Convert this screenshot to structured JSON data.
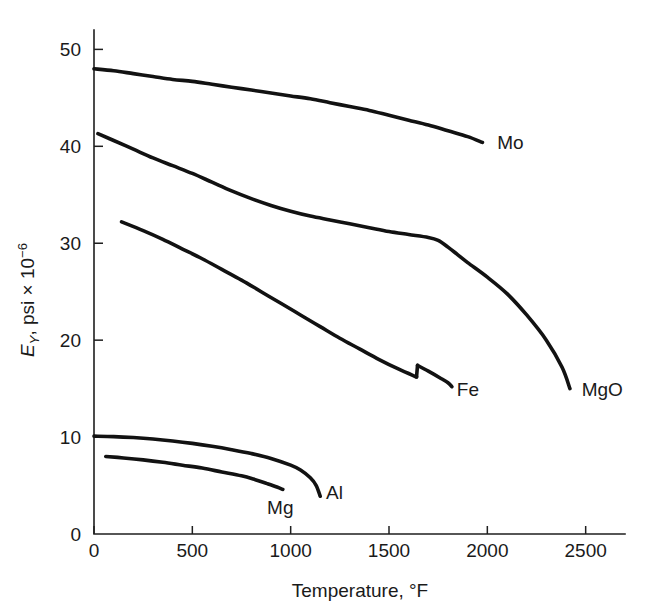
{
  "chart_data": {
    "type": "line",
    "title": "",
    "xlabel": "Temperature, °F",
    "ylabel": "Eᵧ, psi × 10⁻⁶",
    "ylabel_parts": {
      "symbol": "E",
      "subscript": "Y",
      "rest": ", psi × 10",
      "exponent": "−6"
    },
    "xlim": [
      0,
      2700
    ],
    "ylim": [
      0,
      52
    ],
    "xticks": [
      0,
      500,
      1000,
      1500,
      2000,
      2500
    ],
    "xticklabels": [
      "0",
      "500",
      "1000",
      "1500",
      "2000",
      "2500"
    ],
    "yticks": [
      0,
      10,
      20,
      30,
      40,
      50
    ],
    "yticklabels": [
      "0",
      "10",
      "20",
      "30",
      "40",
      "50"
    ],
    "grid": false,
    "legend": "inline-end-of-curve",
    "series": [
      {
        "name": "Mo",
        "label": "Mo",
        "label_x": 2050,
        "label_y": 40.2,
        "color": "#121212",
        "points": [
          [
            0,
            48.0
          ],
          [
            100,
            47.8
          ],
          [
            200,
            47.5
          ],
          [
            300,
            47.2
          ],
          [
            400,
            46.9
          ],
          [
            500,
            46.7
          ],
          [
            600,
            46.4
          ],
          [
            700,
            46.1
          ],
          [
            800,
            45.8
          ],
          [
            900,
            45.5
          ],
          [
            1000,
            45.2
          ],
          [
            1100,
            44.9
          ],
          [
            1200,
            44.5
          ],
          [
            1300,
            44.1
          ],
          [
            1400,
            43.7
          ],
          [
            1500,
            43.2
          ],
          [
            1600,
            42.7
          ],
          [
            1700,
            42.2
          ],
          [
            1800,
            41.6
          ],
          [
            1900,
            41.0
          ],
          [
            1975,
            40.4
          ]
        ]
      },
      {
        "name": "MgO",
        "label": "MgO",
        "label_x": 2480,
        "label_y": 14.8,
        "color": "#121212",
        "points": [
          [
            20,
            41.3
          ],
          [
            100,
            40.6
          ],
          [
            200,
            39.7
          ],
          [
            300,
            38.8
          ],
          [
            400,
            38.0
          ],
          [
            500,
            37.2
          ],
          [
            600,
            36.3
          ],
          [
            700,
            35.4
          ],
          [
            800,
            34.6
          ],
          [
            900,
            33.9
          ],
          [
            1000,
            33.3
          ],
          [
            1100,
            32.8
          ],
          [
            1200,
            32.4
          ],
          [
            1300,
            32.0
          ],
          [
            1400,
            31.6
          ],
          [
            1500,
            31.2
          ],
          [
            1600,
            30.9
          ],
          [
            1700,
            30.6
          ],
          [
            1750,
            30.3
          ],
          [
            1800,
            29.6
          ],
          [
            1850,
            28.8
          ],
          [
            1900,
            28.0
          ],
          [
            2000,
            26.5
          ],
          [
            2100,
            24.8
          ],
          [
            2200,
            22.6
          ],
          [
            2300,
            20.0
          ],
          [
            2380,
            17.2
          ],
          [
            2420,
            15.0
          ]
        ]
      },
      {
        "name": "Fe",
        "label": "Fe",
        "label_x": 1845,
        "label_y": 14.8,
        "color": "#121212",
        "has_discontinuity": true,
        "discontinuity_temp": 1640,
        "segments": [
          {
            "points": [
              [
                140,
                32.2
              ],
              [
                250,
                31.3
              ],
              [
                350,
                30.4
              ],
              [
                450,
                29.4
              ],
              [
                550,
                28.4
              ],
              [
                650,
                27.3
              ],
              [
                750,
                26.2
              ],
              [
                850,
                25.0
              ],
              [
                950,
                23.8
              ],
              [
                1050,
                22.6
              ],
              [
                1150,
                21.4
              ],
              [
                1250,
                20.2
              ],
              [
                1350,
                19.1
              ],
              [
                1450,
                18.0
              ],
              [
                1550,
                17.0
              ],
              [
                1640,
                16.2
              ]
            ]
          },
          {
            "points": [
              [
                1645,
                17.4
              ],
              [
                1700,
                16.8
              ],
              [
                1760,
                16.1
              ],
              [
                1800,
                15.6
              ],
              [
                1820,
                15.2
              ]
            ]
          }
        ]
      },
      {
        "name": "Al",
        "label": "Al",
        "label_x": 1180,
        "label_y": 4.1,
        "color": "#121212",
        "points": [
          [
            0,
            10.1
          ],
          [
            100,
            10.05
          ],
          [
            200,
            9.95
          ],
          [
            300,
            9.8
          ],
          [
            400,
            9.6
          ],
          [
            500,
            9.35
          ],
          [
            600,
            9.05
          ],
          [
            700,
            8.7
          ],
          [
            800,
            8.3
          ],
          [
            900,
            7.8
          ],
          [
            1000,
            7.1
          ],
          [
            1050,
            6.6
          ],
          [
            1100,
            5.8
          ],
          [
            1130,
            5.0
          ],
          [
            1150,
            3.9
          ]
        ]
      },
      {
        "name": "Mg",
        "label": "Mg",
        "label_x": 880,
        "label_y": 2.6,
        "color": "#121212",
        "points": [
          [
            60,
            8.0
          ],
          [
            150,
            7.85
          ],
          [
            250,
            7.65
          ],
          [
            350,
            7.4
          ],
          [
            450,
            7.1
          ],
          [
            550,
            6.8
          ],
          [
            650,
            6.4
          ],
          [
            750,
            6.0
          ],
          [
            820,
            5.6
          ],
          [
            880,
            5.2
          ],
          [
            930,
            4.85
          ],
          [
            960,
            4.6
          ]
        ]
      }
    ]
  },
  "axis_geometry": {
    "plot_left_px": 94,
    "plot_bottom_px": 534,
    "plot_right_px": 625,
    "plot_top_px": 30
  }
}
